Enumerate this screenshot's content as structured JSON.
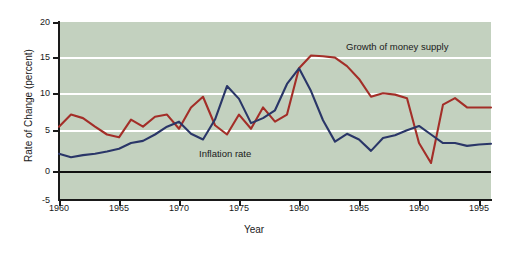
{
  "chart_data": {
    "type": "line",
    "title": "",
    "xlabel": "Year",
    "ylabel": "Rate of Change (percent)",
    "xlim": [
      1960,
      1996
    ],
    "ylim": [
      -5,
      20
    ],
    "xticks": [
      1960,
      1965,
      1970,
      1975,
      1980,
      1985,
      1990,
      1995
    ],
    "yticks": [
      -5,
      0,
      5,
      10,
      15,
      20
    ],
    "xtick_labels": [
      "1960",
      "1965",
      "1970",
      "1975",
      "1980",
      "1985",
      "1990",
      "1995"
    ],
    "ytick_labels": [
      "-5",
      "0",
      "5",
      "10",
      "15",
      "20"
    ],
    "grid": "horizontal-white-at-5-10-15",
    "legend_position": "inline-annotations",
    "background": "#c3d1bf",
    "x": [
      1960,
      1961,
      1962,
      1963,
      1964,
      1965,
      1966,
      1967,
      1968,
      1969,
      1970,
      1971,
      1972,
      1973,
      1974,
      1975,
      1976,
      1977,
      1978,
      1979,
      1980,
      1981,
      1982,
      1983,
      1984,
      1985,
      1986,
      1987,
      1988,
      1989,
      1990,
      1991,
      1992,
      1993,
      1994,
      1995,
      1996
    ],
    "series": [
      {
        "name": "Growth of money supply",
        "color": "#a32e28",
        "values": [
          5.3,
          7.0,
          6.5,
          5.3,
          4.2,
          3.8,
          6.3,
          5.3,
          6.7,
          7.0,
          5.0,
          8.0,
          9.5,
          5.5,
          4.2,
          7.0,
          5.0,
          8.0,
          6.0,
          7.0,
          13.5,
          15.3,
          15.2,
          15.0,
          13.8,
          12.0,
          9.5,
          10.0,
          9.8,
          9.3,
          3.0,
          0.2,
          8.4,
          9.3,
          8.0,
          8.0,
          8.0
        ]
      },
      {
        "name": "Inflation rate",
        "color": "#2a3668",
        "values": [
          1.5,
          1.0,
          1.3,
          1.5,
          1.8,
          2.2,
          3.0,
          3.3,
          4.2,
          5.3,
          6.0,
          4.3,
          3.5,
          6.3,
          11.0,
          9.2,
          5.8,
          6.5,
          7.6,
          11.3,
          13.5,
          10.3,
          6.2,
          3.2,
          4.3,
          3.5,
          1.9,
          3.7,
          4.1,
          4.8,
          5.4,
          4.2,
          3.0,
          3.0,
          2.6,
          2.8,
          2.9
        ]
      }
    ],
    "annotations": [
      {
        "text": "Growth of money supply",
        "x": 1985,
        "y": 17
      },
      {
        "text": "Inflation rate",
        "x": 1973,
        "y": 2.5
      }
    ]
  },
  "axis": {
    "ylabel": "Rate of Change (percent)",
    "xlabel": "Year"
  }
}
